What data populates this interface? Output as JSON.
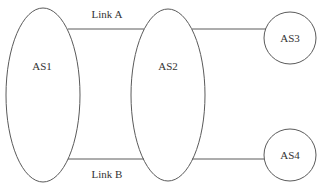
{
  "diagram": {
    "type": "network-topology",
    "nodes": [
      {
        "id": "AS1",
        "label": "AS1",
        "shape": "ellipse"
      },
      {
        "id": "AS2",
        "label": "AS2",
        "shape": "ellipse"
      },
      {
        "id": "AS3",
        "label": "AS3",
        "shape": "circle"
      },
      {
        "id": "AS4",
        "label": "AS4",
        "shape": "circle"
      }
    ],
    "links": [
      {
        "from": "AS1",
        "to": "AS2",
        "label": "Link A"
      },
      {
        "from": "AS1",
        "to": "AS2",
        "label": "Link B"
      },
      {
        "from": "AS2",
        "to": "AS3",
        "label": ""
      },
      {
        "from": "AS2",
        "to": "AS4",
        "label": ""
      }
    ],
    "colors": {
      "stroke": "#5a5a5a",
      "text": "#333333",
      "background": "#ffffff"
    }
  }
}
